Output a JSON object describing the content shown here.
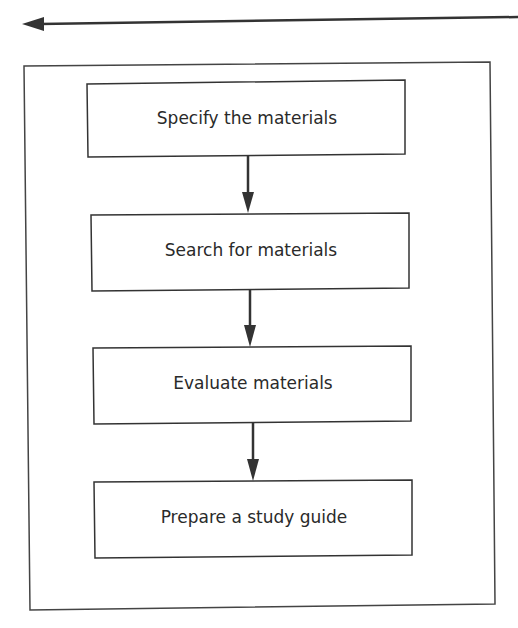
{
  "diagram": {
    "type": "flowchart",
    "direction": "top-to-bottom",
    "colors": {
      "line": "#333333",
      "text": "#2a2a2a",
      "background": "#ffffff"
    },
    "top_arrow": {
      "direction": "left"
    },
    "steps": [
      {
        "label": "Specify the materials"
      },
      {
        "label": "Search for materials"
      },
      {
        "label": "Evaluate materials"
      },
      {
        "label": "Prepare a study guide"
      }
    ]
  }
}
